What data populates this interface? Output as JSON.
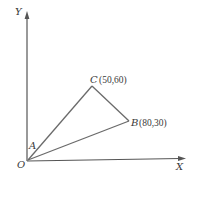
{
  "diagram": {
    "axes": {
      "x_label": "X",
      "y_label": "Y",
      "origin_label": "O"
    },
    "points": {
      "A": {
        "name": "A",
        "coords_text": ""
      },
      "B": {
        "name": "B",
        "coords_text": "(80,30)"
      },
      "C": {
        "name": "C",
        "coords_text": "(50,60)"
      }
    },
    "colors": {
      "axis": "#555555",
      "edge": "#6a6a6a",
      "text": "#3a3a3a"
    }
  }
}
